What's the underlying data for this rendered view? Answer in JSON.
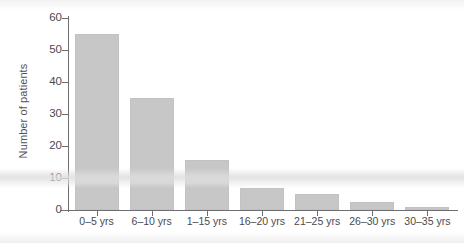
{
  "chart_data": {
    "type": "bar",
    "title": "",
    "xlabel": "",
    "ylabel": "Number of patients",
    "categories": [
      "0–5 yrs",
      "6–10 yrs",
      "1–15 yrs",
      "16–20 yrs",
      "21–25 yrs",
      "26–30 yrs",
      "30–35 yrs"
    ],
    "values": [
      55,
      35,
      15.5,
      7,
      5,
      2.5,
      1
    ],
    "ylim": [
      0,
      60
    ],
    "ytick_values": [
      0,
      10,
      20,
      30,
      40,
      50,
      60
    ],
    "ytick_labels": [
      "0",
      "10",
      "20",
      "30",
      "40",
      "50",
      "60"
    ],
    "grid": false,
    "legend": null,
    "bar_color": "#c7c7c7",
    "axis_color": "#6e6e72",
    "text_color": "#4a4a50",
    "background": "#ffffff"
  }
}
